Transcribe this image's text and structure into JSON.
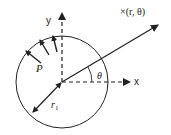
{
  "diagram": {
    "labels": {
      "y_axis": "y",
      "x_axis": "x",
      "point": "×(r, θ)",
      "pressure": "P",
      "radius": "r",
      "radius_subscript": "1",
      "angle": "θ"
    },
    "colors": {
      "stroke": "#222222",
      "background": "#ffffff"
    },
    "geometry": {
      "center": [
        62,
        82
      ],
      "circle_radius": 46,
      "pressure_arrow_count": 3
    }
  }
}
